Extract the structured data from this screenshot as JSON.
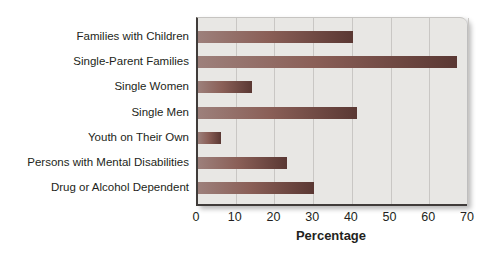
{
  "chart_data": {
    "type": "bar",
    "orientation": "horizontal",
    "title": "",
    "xlabel": "Percentage",
    "ylabel": "",
    "categories": [
      "Families with Children",
      "Single-Parent Families",
      "Single Women",
      "Single Men",
      "Youth on Their Own",
      "Persons with Mental Disabilities",
      "Drug or Alcohol Dependent"
    ],
    "values": [
      40,
      67,
      14,
      41,
      6,
      23,
      30
    ],
    "xlim": [
      0,
      70
    ],
    "xticks": [
      0,
      10,
      20,
      30,
      40,
      50,
      60,
      70
    ],
    "grid": true,
    "legend_position": "none"
  },
  "colors": {
    "bar_gradient_start": "#9d807b",
    "bar_gradient_mid": "#8a5f57",
    "bar_gradient_end": "#5a3833",
    "plot_background": "#e8e7e4",
    "gridline": "#c9c7c4",
    "axis_line": "#403c3a",
    "text": "#231f20",
    "page_background": "#ffffff"
  }
}
